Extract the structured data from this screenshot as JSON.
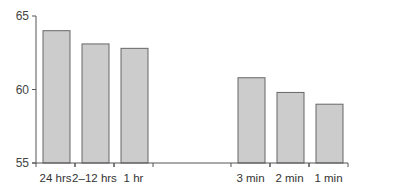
{
  "chart_data": {
    "type": "bar",
    "title": "",
    "xlabel": "",
    "ylabel": "",
    "ylim": [
      55,
      65
    ],
    "yticks": [
      55,
      60,
      65
    ],
    "grid": false,
    "legend": null,
    "categories": [
      "24 hrs",
      "2–12 hrs",
      "1 hr",
      "",
      "",
      "3 min",
      "2 min",
      "1 min"
    ],
    "values": [
      64.0,
      63.1,
      62.8,
      null,
      null,
      60.8,
      59.8,
      59.0
    ],
    "bar_color": "#cccccc",
    "bar_edge_color": "#666666"
  }
}
